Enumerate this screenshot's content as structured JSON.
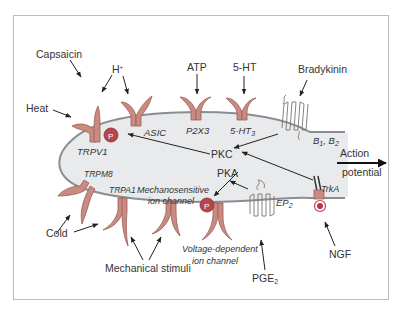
{
  "diagram": {
    "colors": {
      "membrane_fill": "#e9eaec",
      "membrane_stroke": "#8a8d92",
      "channel_fill": "#c98a82",
      "channel_stroke": "#9b5f58",
      "phospho_fill": "#b5464a",
      "arrow": "#222222",
      "frame": "#b8bcc6"
    },
    "stimuli": {
      "capsaicin": "Capsaicin",
      "heat": "Heat",
      "h_plus": "H",
      "h_plus_sup": "+",
      "atp": "ATP",
      "serotonin": "5-HT",
      "bradykinin": "Bradykinin",
      "cold": "Cold",
      "mechanical": "Mechanical stimuli",
      "pge2": "PGE",
      "pge2_sub": "2",
      "ngf": "NGF"
    },
    "receptors": {
      "trpv1": "TRPV1",
      "asic": "ASIC",
      "p2x3": "P2X3",
      "ht3": "5-HT",
      "ht3_sub": "3",
      "b1b2_a": "B",
      "b1_sub": "1",
      "b1b2_sep": ", B",
      "b2_sub": "2",
      "trpm8": "TRPM8",
      "trpa1": "TRPA1",
      "mechano_line1": "Mechanosensitive",
      "mechano_line2": "ion channel",
      "voltage_line1": "Voltage-dependent",
      "voltage_line2": "ion channel",
      "ep2": "EP",
      "ep2_sub": "2",
      "trka": "TrkA"
    },
    "kinases": {
      "pkc": "PKC",
      "pka": "PKA",
      "phospho": "P"
    },
    "output": {
      "line1": "Action",
      "line2": "potential"
    }
  }
}
